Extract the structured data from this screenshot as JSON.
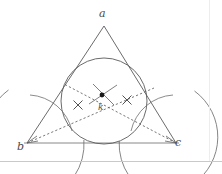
{
  "figure": {
    "type": "geometry-diagram",
    "background_color": "#ffffff",
    "stroke_color": "#5a5a5a",
    "dash_color": "#6b6b6b",
    "label_color": "#4a4a4a",
    "dot_color": "#1a1a1a"
  },
  "labels": {
    "apex": "a",
    "bottom_left": "b",
    "bottom_right": "c",
    "incenter": "k"
  },
  "geometry": {
    "triangle": {
      "apex": {
        "x": 104,
        "y": 26
      },
      "bottom_left": {
        "x": 27,
        "y": 143
      },
      "bottom_right": {
        "x": 176,
        "y": 143
      }
    },
    "incircle": {
      "center_x": 104,
      "center_y": 101,
      "radius": 43
    },
    "incenter_dot": {
      "x": 102,
      "y": 95,
      "radius": 2.4
    },
    "bisector_from_b": {
      "x1": 27,
      "y1": 143,
      "x2": 152,
      "y2": 89
    },
    "bisector_from_c": {
      "x1": 176,
      "y1": 143,
      "x2": 66,
      "y2": 85
    },
    "tick_marks": [
      {
        "x": 78,
        "y": 105,
        "size": 4.5,
        "label": "congruence-tick-left"
      },
      {
        "x": 127,
        "y": 100,
        "size": 4.5,
        "label": "congruence-tick-right"
      }
    ],
    "construction_arcs": [
      {
        "cx": 27,
        "cy": 143,
        "r": 57,
        "a_start": -72,
        "a_end": -3,
        "name": "arc-from-b"
      },
      {
        "cx": 176,
        "cy": 143,
        "r": 57,
        "a_start": 183,
        "a_end": 252,
        "name": "arc-from-c"
      },
      {
        "cx": 27,
        "cy": 143,
        "r": 32,
        "a_start": -76,
        "a_end": -4,
        "name": "arc-small-b"
      },
      {
        "cx": 176,
        "cy": 143,
        "r": 32,
        "a_start": 184,
        "a_end": 256,
        "name": "arc-small-c"
      },
      {
        "cx": 104,
        "cy": 101,
        "r": 43,
        "a_start": 55,
        "a_end": 125,
        "name": "arc-incircle-bottom"
      }
    ],
    "center_cross_arcs": [
      {
        "x1": 88,
        "y1": 105,
        "x2": 116,
        "y2": 86,
        "name": "cross-stroke-1"
      },
      {
        "x1": 92,
        "y1": 85,
        "x2": 115,
        "y2": 106,
        "name": "cross-stroke-2"
      }
    ]
  }
}
